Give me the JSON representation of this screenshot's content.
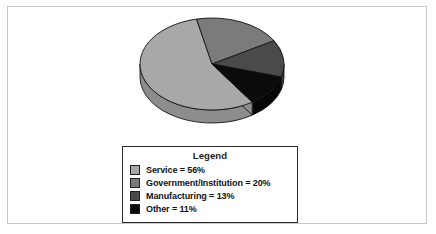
{
  "figure": {
    "background_color": "#ffffff",
    "frame_color": "#c9c9c9"
  },
  "legend": {
    "title": "Legend",
    "items": [
      {
        "label": "Service = 56%",
        "color": "#a8a8a8"
      },
      {
        "label": "Government/Institution = 20%",
        "color": "#7b7b7b"
      },
      {
        "label": "Manufacturing = 13%",
        "color": "#4a4a4a"
      },
      {
        "label": "Other = 11%",
        "color": "#0b0b0b"
      }
    ]
  },
  "chart_data": {
    "type": "pie",
    "title": "",
    "three_d": true,
    "labels": [
      "Service",
      "Government/Institution",
      "Manufacturing",
      "Other"
    ],
    "values": [
      56,
      20,
      13,
      11
    ],
    "unit": "%",
    "colors": [
      "#a8a8a8",
      "#7b7b7b",
      "#4a4a4a",
      "#0b0b0b"
    ],
    "side_colors": [
      "#8d8d8d",
      "#686868",
      "#3c3c3c",
      "#070707"
    ],
    "edge_color": "#141414",
    "start_angle_deg": 56,
    "direction": "clockwise",
    "legend_position": "bottom",
    "legend_title": "Legend",
    "grid": false,
    "xlabel": "",
    "ylabel": ""
  }
}
